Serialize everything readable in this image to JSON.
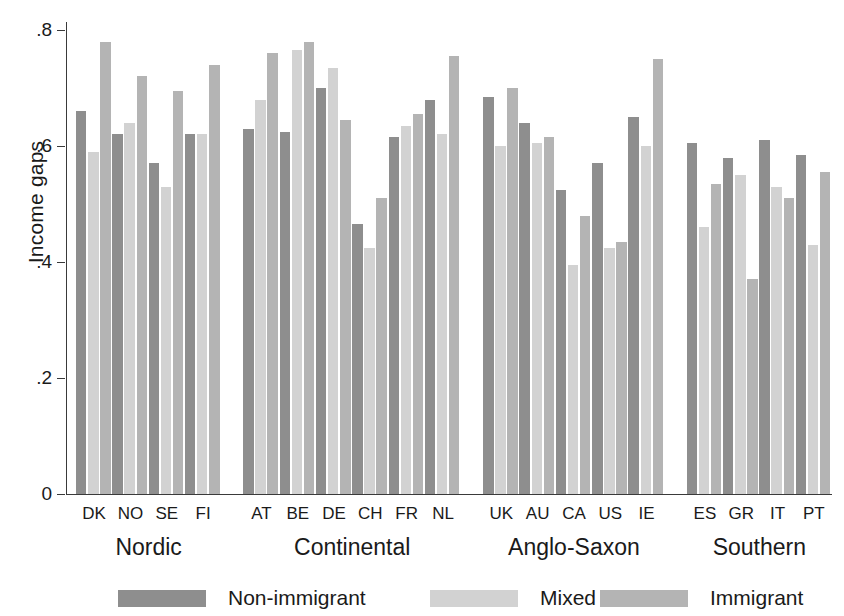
{
  "chart_data": {
    "type": "bar",
    "title": "",
    "subtitle": "",
    "xlabel": "",
    "ylabel": "Income gaps",
    "ylim": [
      0,
      0.8
    ],
    "yticks": [
      0,
      0.2,
      0.4,
      0.6,
      0.8
    ],
    "ytick_labels": [
      "0",
      ".2",
      ".4",
      ".6",
      ".8"
    ],
    "grid": false,
    "legend_position": "bottom",
    "categories": [
      "DK",
      "NO",
      "SE",
      "FI",
      "AT",
      "BE",
      "DE",
      "CH",
      "FR",
      "NL",
      "UK",
      "AU",
      "CA",
      "US",
      "IE",
      "ES",
      "GR",
      "IT",
      "PT"
    ],
    "series": [
      {
        "name": "Non-immigrant",
        "color": "#8e8e8e",
        "values": [
          0.66,
          0.62,
          0.57,
          0.62,
          0.63,
          0.625,
          0.7,
          0.465,
          0.615,
          0.68,
          0.685,
          0.64,
          0.525,
          0.57,
          0.65,
          0.605,
          0.58,
          0.61,
          0.585
        ]
      },
      {
        "name": "Mixed",
        "color": "#d2d2d2",
        "values": [
          0.59,
          0.64,
          0.53,
          0.62,
          0.68,
          0.765,
          0.735,
          0.425,
          0.635,
          0.62,
          0.6,
          0.605,
          0.395,
          0.425,
          0.6,
          0.46,
          0.55,
          0.53,
          0.43
        ]
      },
      {
        "name": "Immigrant",
        "color": "#b4b4b4",
        "values": [
          0.78,
          0.72,
          0.695,
          0.74,
          0.76,
          0.78,
          0.645,
          0.51,
          0.655,
          0.755,
          0.7,
          0.615,
          0.48,
          0.435,
          0.75,
          0.535,
          0.37,
          0.51,
          0.555
        ]
      }
    ],
    "groups": [
      {
        "label": "Nordic",
        "categories": [
          "DK",
          "NO",
          "SE",
          "FI"
        ]
      },
      {
        "label": "Continental",
        "categories": [
          "AT",
          "BE",
          "DE",
          "CH",
          "FR",
          "NL"
        ]
      },
      {
        "label": "Anglo-Saxon",
        "categories": [
          "UK",
          "AU",
          "CA",
          "US",
          "IE"
        ]
      },
      {
        "label": "Southern",
        "categories": [
          "ES",
          "GR",
          "IT",
          "PT"
        ]
      }
    ]
  },
  "legend": {
    "items": [
      {
        "label": "Non-immigrant"
      },
      {
        "label": "Mixed"
      },
      {
        "label": "Immigrant"
      }
    ]
  }
}
